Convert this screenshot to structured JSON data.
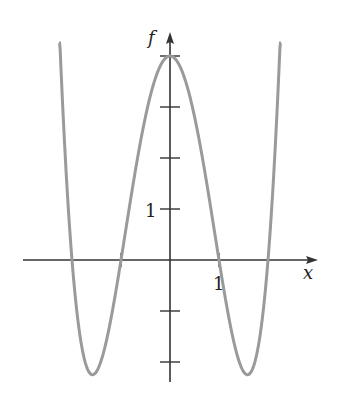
{
  "chart_data": {
    "type": "line",
    "title": "",
    "function": "f(x) = x^4 - 5x^2 + 4",
    "xlabel": "x",
    "ylabel": "f",
    "xlim": [
      -3.0,
      3.0
    ],
    "ylim": [
      -2.4,
      4.4
    ],
    "x_ticks": [
      -2,
      -1,
      1,
      2
    ],
    "y_ticks": [
      -2,
      -1,
      1,
      2,
      3,
      4
    ],
    "x_tick_labels": [
      {
        "value": 1,
        "label": "1"
      }
    ],
    "y_tick_labels": [
      {
        "value": 1,
        "label": "1"
      }
    ],
    "grid": false,
    "legend": null,
    "series": [
      {
        "name": "f",
        "color": "#9a9a9a",
        "x": [
          -2.3,
          -2.0,
          -1.58,
          -1.0,
          -0.5,
          0,
          0.5,
          1.0,
          1.58,
          2.0,
          2.3
        ],
        "values": [
          5.53,
          0,
          -2.25,
          0,
          2.81,
          4,
          2.81,
          0,
          -2.25,
          0,
          5.53
        ]
      }
    ],
    "key_points": {
      "zeros": [
        -2,
        -1,
        1,
        2
      ],
      "local_max": {
        "x": 0,
        "y": 4
      },
      "local_mins": [
        {
          "x": -1.58,
          "y": -2.25
        },
        {
          "x": 1.58,
          "y": -2.25
        }
      ]
    }
  },
  "labels": {
    "x_axis": "x",
    "y_axis": "f",
    "x_tick_one": "1",
    "y_tick_one": "1"
  },
  "style": {
    "axis_color": "#333333",
    "curve_color": "#9a9a9a"
  }
}
